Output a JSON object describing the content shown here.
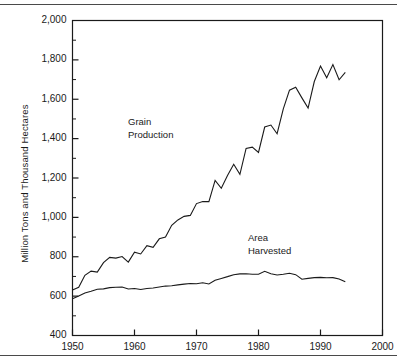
{
  "figure": {
    "rules": {
      "top": "top-rule",
      "bottom": "bottom-rule"
    }
  },
  "chart_data": {
    "type": "line",
    "title": "",
    "xlabel": "",
    "ylabel": "Million Tons and Thousand Hectares",
    "xlim": [
      1950,
      2000
    ],
    "ylim": [
      400,
      2000
    ],
    "grid": false,
    "legend_position": "inline-annotation",
    "xticks": [
      1950,
      1960,
      1970,
      1980,
      1990,
      2000
    ],
    "xtick_labels": [
      "1950",
      "1960",
      "1970",
      "1980",
      "1990",
      "2000"
    ],
    "yticks": [
      400,
      600,
      800,
      1000,
      1200,
      1400,
      1600,
      1800,
      2000
    ],
    "ytick_labels": [
      "400",
      "600",
      "800",
      "1,000",
      "1,200",
      "1,400",
      "1,600",
      "1,800",
      "2,000"
    ],
    "yminor_ticks": [
      500,
      700,
      900,
      1100,
      1300,
      1500,
      1700,
      1900
    ],
    "annotations": [
      {
        "name": "grain-production-label",
        "text": "Grain\nProduction",
        "line1": "Grain",
        "line2": "Production",
        "x": 1962,
        "y": 1420
      },
      {
        "name": "area-harvested-label",
        "text": "Area\nHarvested",
        "line1": "Area",
        "line2": "Harvested",
        "x": 1980,
        "y": 880
      }
    ],
    "x": [
      1950,
      1951,
      1952,
      1953,
      1954,
      1955,
      1956,
      1957,
      1958,
      1959,
      1960,
      1961,
      1962,
      1963,
      1964,
      1965,
      1966,
      1967,
      1968,
      1969,
      1970,
      1971,
      1972,
      1973,
      1974,
      1975,
      1976,
      1977,
      1978,
      1979,
      1980,
      1981,
      1982,
      1983,
      1984,
      1985,
      1986,
      1987,
      1988,
      1989,
      1990,
      1991,
      1992,
      1993,
      1994
    ],
    "series": [
      {
        "name": "Grain Production",
        "units": "Million Tons",
        "values": [
          631,
          645,
          706,
          727,
          722,
          770,
          797,
          793,
          801,
          773,
          823,
          814,
          856,
          848,
          891,
          900,
          960,
          987,
          1005,
          1010,
          1070,
          1081,
          1080,
          1188,
          1148,
          1213,
          1270,
          1219,
          1350,
          1357,
          1330,
          1459,
          1469,
          1425,
          1551,
          1646,
          1661,
          1607,
          1555,
          1690,
          1769,
          1709,
          1776,
          1699,
          1736
        ]
      },
      {
        "name": "Area Harvested",
        "units": "Thousand Hectares",
        "values": [
          587,
          601,
          616,
          625,
          635,
          637,
          643,
          645,
          646,
          636,
          639,
          634,
          639,
          641,
          646,
          651,
          653,
          657,
          661,
          664,
          663,
          668,
          662,
          681,
          690,
          699,
          709,
          713,
          714,
          711,
          711,
          726,
          714,
          707,
          711,
          716,
          709,
          686,
          690,
          694,
          695,
          693,
          694,
          687,
          673
        ]
      }
    ]
  }
}
